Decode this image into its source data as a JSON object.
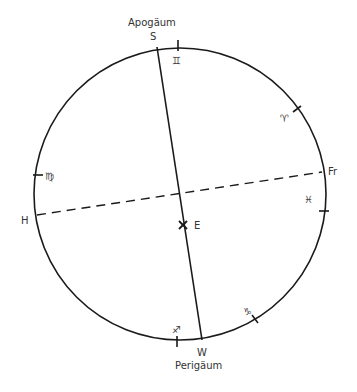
{
  "diagram": {
    "title_top": "Apogäum",
    "title_bottom": "Perigäum",
    "stroke_color": "#1a1a1a",
    "circle": {
      "cx": 180,
      "cy": 194,
      "r": 146
    },
    "points": {
      "S": {
        "label": "S"
      },
      "W": {
        "label": "W"
      },
      "H": {
        "label": "H"
      },
      "Fr": {
        "label": "Fr"
      },
      "E": {
        "label": "E"
      }
    },
    "lines": [
      {
        "name": "apsidal-line",
        "from": "S",
        "to": "W",
        "style": "solid"
      },
      {
        "name": "equinox-line",
        "from": "H",
        "to": "Fr",
        "style": "dashed"
      }
    ],
    "zodiac_marks": [
      {
        "name": "gemini",
        "glyph": "♊"
      },
      {
        "name": "aries",
        "glyph": "♈"
      },
      {
        "name": "pisces",
        "glyph": "♓"
      },
      {
        "name": "virgo",
        "glyph": "♍"
      },
      {
        "name": "capricorn",
        "glyph": "♑"
      },
      {
        "name": "sagittarius",
        "glyph": "♐"
      }
    ]
  }
}
